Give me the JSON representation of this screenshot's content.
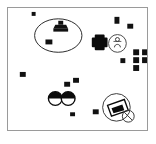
{
  "canvas": {
    "title": "annotated-scene-canvas",
    "width": 156,
    "height": 144,
    "frame": {
      "x": 7,
      "y": 7,
      "width": 141,
      "height": 124,
      "border_color": "#9a9a9a"
    },
    "background_color": "#ffffff",
    "ink_color": "#000000",
    "annotation_color": "#3a3a3a"
  },
  "markers": [
    {
      "id": "marker-01",
      "x": 31,
      "y": 12,
      "w": 4,
      "h": 4
    },
    {
      "id": "marker-02",
      "x": 115,
      "y": 16,
      "w": 5,
      "h": 7
    },
    {
      "id": "marker-03",
      "x": 128,
      "y": 23,
      "w": 6,
      "h": 5
    },
    {
      "id": "marker-04",
      "x": 44,
      "y": 38,
      "w": 7,
      "h": 5
    },
    {
      "id": "marker-05",
      "x": 121,
      "y": 58,
      "w": 5,
      "h": 5
    },
    {
      "id": "marker-06",
      "x": 135,
      "y": 50,
      "w": 5,
      "h": 5
    },
    {
      "id": "marker-07",
      "x": 143,
      "y": 50,
      "w": 5,
      "h": 5
    },
    {
      "id": "marker-08",
      "x": 135,
      "y": 57,
      "w": 5,
      "h": 5
    },
    {
      "id": "marker-09",
      "x": 143,
      "y": 57,
      "w": 5,
      "h": 5
    },
    {
      "id": "marker-10",
      "x": 135,
      "y": 64,
      "w": 5,
      "h": 5
    },
    {
      "id": "marker-11",
      "x": 19,
      "y": 72,
      "w": 6,
      "h": 5
    },
    {
      "id": "marker-12",
      "x": 64,
      "y": 82,
      "w": 6,
      "h": 5
    },
    {
      "id": "marker-13",
      "x": 73,
      "y": 78,
      "w": 6,
      "h": 5
    },
    {
      "id": "marker-14",
      "x": 70,
      "y": 113,
      "w": 5,
      "h": 4
    },
    {
      "id": "marker-15",
      "x": 93,
      "y": 110,
      "w": 6,
      "h": 5
    }
  ],
  "shapes": {
    "ellipse_region": {
      "name": "annotation-ellipse",
      "cx": 58,
      "cy": 35,
      "rx": 24,
      "ry": 17
    },
    "stamp_icon": {
      "name": "stamp-icon",
      "x": 60,
      "y": 21
    },
    "inner_square": {
      "name": "ellipse-inner-marker",
      "x": 45,
      "y": 39,
      "w": 6,
      "h": 5
    },
    "cross_icon": {
      "name": "plus-cross-icon",
      "cx": 100,
      "cy": 40,
      "size": 16
    },
    "circled_symbol": {
      "name": "circled-figure-icon",
      "cx": 118,
      "cy": 43,
      "r": 9
    },
    "half_circle_left": {
      "name": "half-filled-circle-left",
      "cx": 55,
      "cy": 99,
      "r": 7
    },
    "half_circle_right": {
      "name": "half-filled-circle-right",
      "cx": 68,
      "cy": 99,
      "r": 7
    },
    "highlight_circle": {
      "name": "highlight-circle",
      "cx": 117,
      "cy": 108,
      "r": 14
    },
    "quad_shape": {
      "name": "parallelogram-shape",
      "cx": 117,
      "cy": 108
    },
    "small_circle": {
      "name": "small-overlap-circle",
      "cx": 129,
      "cy": 117,
      "r": 6
    }
  },
  "labels": {
    "canvas_label": "",
    "frame_label": ""
  }
}
